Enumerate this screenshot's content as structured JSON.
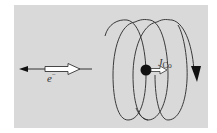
{
  "diagram": {
    "title": "",
    "background_color": "#d9d9d9",
    "line_color": "#333333",
    "electron": {
      "label": "e",
      "label_superscript": "−",
      "momentum_arrow": "left (thin black arrow)",
      "spin_arrow": "right (hollow double arrow)"
    },
    "nucleus": {
      "label": "J",
      "label_subscript": "Co",
      "spin_arrow": "right (hollow arrow)",
      "shape": "filled black circle"
    },
    "coil": {
      "loops": 3,
      "current_direction_arrow": "down (right side)"
    }
  }
}
